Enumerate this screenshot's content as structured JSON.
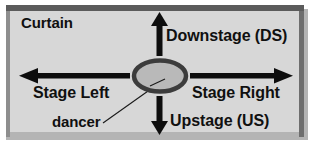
{
  "diagram": {
    "colors": {
      "stage_fill": "#d7d7d7",
      "frame_dark": "#5b5b5b",
      "frame_light": "#b4b4b4",
      "arrow": "#0d0d0d",
      "dancer_fill": "#b9b9b9",
      "dancer_stroke": "#3c3c3c",
      "text": "#101010",
      "page_background": "#ffffff"
    },
    "labels": {
      "curtain": "Curtain",
      "downstage": "Downstage (DS)",
      "stage_left": "Stage Left",
      "stage_right": "Stage Right",
      "dancer": "dancer",
      "upstage": "Upstage (US)"
    },
    "arrows": [
      {
        "name": "up-arrow",
        "direction": "up",
        "points_to": "Downstage (DS)"
      },
      {
        "name": "down-arrow",
        "direction": "down",
        "points_to": "Upstage (US)"
      },
      {
        "name": "left-arrow",
        "direction": "left",
        "points_to": "Stage Left"
      },
      {
        "name": "right-arrow",
        "direction": "right",
        "points_to": "Stage Right"
      }
    ],
    "dancer_marker": {
      "shape": "ellipse",
      "center_x": 160,
      "center_y": 76,
      "radius_x": 27,
      "radius_y": 16
    }
  }
}
